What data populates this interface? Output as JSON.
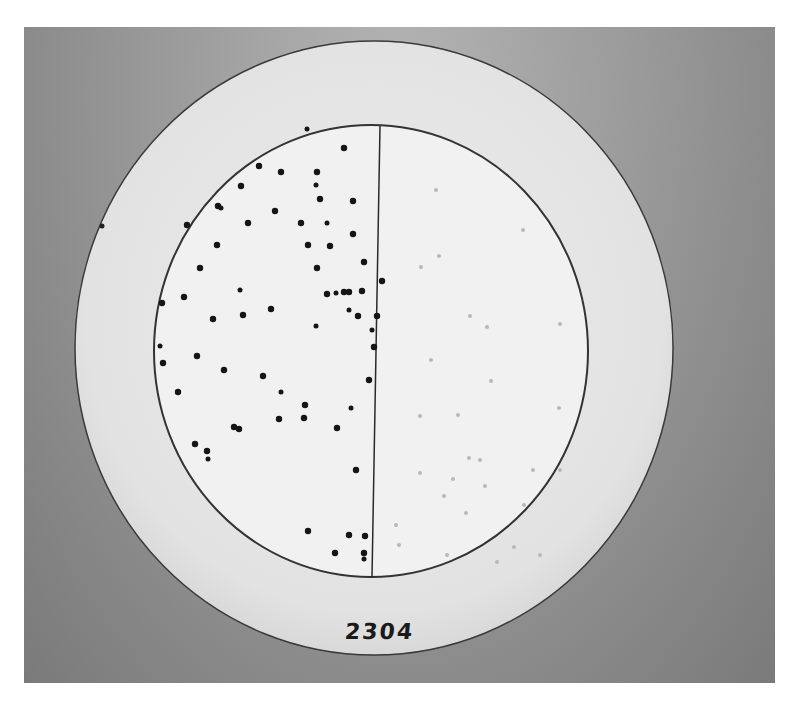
{
  "image": {
    "description": "Black-and-white photograph of a round agar/filter-paper plate divided by a vertical line; left half has many dark colonies, right half has faint light spots",
    "label": "2304",
    "colors": {
      "background": "#9a9a9a",
      "paper": "#e8e8e8",
      "plate": "#f2f2f2",
      "colony": "#151515",
      "faint_spot": "#b8b8b8"
    }
  },
  "plate": {
    "outer_circle": {
      "cx": 374,
      "cy": 348,
      "rx": 299,
      "ry": 307
    },
    "inner_circle": {
      "cx": 371,
      "cy": 351,
      "rx": 217,
      "ry": 226
    },
    "divider_x": 377
  },
  "colonies_left": [
    [
      307,
      129
    ],
    [
      344,
      148
    ],
    [
      259,
      166
    ],
    [
      281,
      172
    ],
    [
      317,
      172
    ],
    [
      316,
      185
    ],
    [
      241,
      186
    ],
    [
      218,
      206
    ],
    [
      320,
      199
    ],
    [
      353,
      201
    ],
    [
      221,
      208
    ],
    [
      187,
      225
    ],
    [
      248,
      223
    ],
    [
      275,
      211
    ],
    [
      301,
      223
    ],
    [
      327,
      223
    ],
    [
      353,
      234
    ],
    [
      217,
      245
    ],
    [
      308,
      245
    ],
    [
      364,
      262
    ],
    [
      240,
      290
    ],
    [
      330,
      246
    ],
    [
      200,
      268
    ],
    [
      317,
      268
    ],
    [
      327,
      294
    ],
    [
      336,
      293
    ],
    [
      344,
      292
    ],
    [
      349,
      292
    ],
    [
      382,
      281
    ],
    [
      362,
      291
    ],
    [
      349,
      310
    ],
    [
      184,
      297
    ],
    [
      213,
      319
    ],
    [
      243,
      315
    ],
    [
      271,
      309
    ],
    [
      316,
      326
    ],
    [
      358,
      316
    ],
    [
      197,
      356
    ],
    [
      377,
      316
    ],
    [
      162,
      303
    ],
    [
      160,
      346
    ],
    [
      163,
      363
    ],
    [
      178,
      392
    ],
    [
      224,
      370
    ],
    [
      263,
      376
    ],
    [
      281,
      392
    ],
    [
      305,
      405
    ],
    [
      279,
      419
    ],
    [
      239,
      429
    ],
    [
      234,
      427
    ],
    [
      351,
      408
    ],
    [
      337,
      428
    ],
    [
      304,
      418
    ],
    [
      207,
      451
    ],
    [
      195,
      444
    ],
    [
      208,
      459
    ],
    [
      356,
      470
    ],
    [
      308,
      531
    ],
    [
      364,
      553
    ],
    [
      365,
      536
    ],
    [
      364,
      559
    ],
    [
      335,
      553
    ],
    [
      349,
      535
    ],
    [
      374,
      347
    ],
    [
      369,
      380
    ],
    [
      372,
      330
    ]
  ],
  "faint_spots_right": [
    [
      436,
      190
    ],
    [
      439,
      256
    ],
    [
      421,
      267
    ],
    [
      523,
      230
    ],
    [
      487,
      327
    ],
    [
      431,
      360
    ],
    [
      470,
      316
    ],
    [
      560,
      324
    ],
    [
      420,
      416
    ],
    [
      458,
      415
    ],
    [
      491,
      381
    ],
    [
      559,
      408
    ],
    [
      480,
      460
    ],
    [
      533,
      470
    ],
    [
      485,
      486
    ],
    [
      420,
      473
    ],
    [
      444,
      496
    ],
    [
      469,
      458
    ],
    [
      560,
      470
    ],
    [
      524,
      505
    ],
    [
      396,
      525
    ],
    [
      399,
      545
    ],
    [
      466,
      513
    ],
    [
      447,
      555
    ],
    [
      453,
      479
    ],
    [
      514,
      547
    ],
    [
      497,
      562
    ],
    [
      540,
      555
    ]
  ]
}
